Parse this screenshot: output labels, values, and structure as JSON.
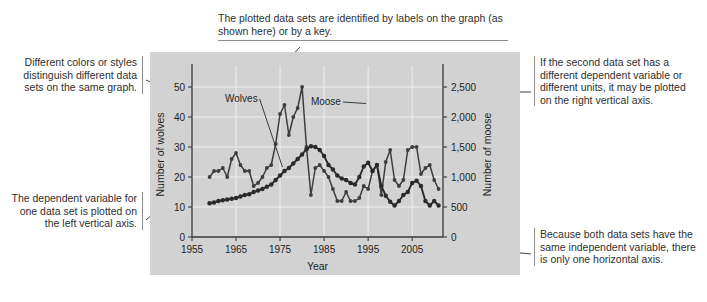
{
  "figure": {
    "kind": "annotated-chart-figure",
    "background": "#ffffff",
    "panel_color": "#d2d2d2"
  },
  "annotations": {
    "top": "The plotted data sets are identified by labels on the graph (as shown here) or by a key.",
    "left_top": "Different colors or styles distinguish different data sets on the same graph.",
    "left_bottom": "The dependent variable for one data set is plotted on the left vertical axis.",
    "right_top": "If the second data set has a different dependent variable or different units, it may be plotted on the right vertical axis.",
    "right_bottom": "Because both data sets have the same independent variable, there is only one horizontal axis."
  },
  "chart_data": {
    "type": "line",
    "title": "",
    "xlabel": "Year",
    "ylabel": "Number of wolves",
    "y2label": "Number of moose",
    "xlim": [
      1955,
      2012
    ],
    "ylim": [
      0,
      55
    ],
    "y2lim": [
      0,
      2750
    ],
    "xticks": [
      1955,
      1965,
      1975,
      1985,
      1995,
      2005
    ],
    "yticks": [
      0,
      10,
      20,
      30,
      40,
      50
    ],
    "y2ticks": [
      "0",
      "500",
      "1,000",
      "1,500",
      "2,000",
      "2,500"
    ],
    "y2tickvalues": [
      0,
      500,
      1000,
      1500,
      2000,
      2500
    ],
    "grid": true,
    "legend_position": "inline-labels",
    "series": [
      {
        "name": "Wolves",
        "axis": "left",
        "color": "#3d3d3d",
        "label_x": 1969,
        "label_y": 46,
        "x": [
          1959,
          1960,
          1961,
          1962,
          1963,
          1964,
          1965,
          1966,
          1967,
          1968,
          1969,
          1970,
          1971,
          1972,
          1973,
          1974,
          1975,
          1976,
          1977,
          1978,
          1979,
          1980,
          1981,
          1982,
          1983,
          1984,
          1985,
          1986,
          1987,
          1988,
          1989,
          1990,
          1991,
          1992,
          1993,
          1994,
          1995,
          1996,
          1997,
          1998,
          1999,
          2000,
          2001,
          2002,
          2003,
          2004,
          2005,
          2006,
          2007,
          2008,
          2009,
          2010,
          2011
        ],
        "values": [
          20,
          22,
          22,
          23,
          20,
          26,
          28,
          24,
          22,
          22,
          17,
          18,
          20,
          23,
          24,
          31,
          41,
          44,
          34,
          40,
          43,
          50,
          30,
          14,
          23,
          24,
          22,
          20,
          16,
          12,
          12,
          15,
          12,
          12,
          13,
          17,
          16,
          22,
          24,
          14,
          25,
          29,
          19,
          17,
          19,
          29,
          30,
          30,
          21,
          23,
          24,
          19,
          16
        ]
      },
      {
        "name": "Moose",
        "axis": "right",
        "color": "#2a2a2a",
        "label_x": 1987,
        "label_y": 45,
        "x": [
          1959,
          1960,
          1961,
          1962,
          1963,
          1964,
          1965,
          1966,
          1967,
          1968,
          1969,
          1970,
          1971,
          1972,
          1973,
          1974,
          1975,
          1976,
          1977,
          1978,
          1979,
          1980,
          1981,
          1982,
          1983,
          1984,
          1985,
          1986,
          1987,
          1988,
          1989,
          1990,
          1991,
          1992,
          1993,
          1994,
          1995,
          1996,
          1997,
          1998,
          1999,
          2000,
          2001,
          2002,
          2003,
          2004,
          2005,
          2006,
          2007,
          2008,
          2009,
          2010,
          2011
        ],
        "values": [
          563,
          575,
          600,
          613,
          625,
          638,
          650,
          675,
          700,
          713,
          750,
          775,
          800,
          838,
          875,
          950,
          1025,
          1100,
          1150,
          1225,
          1300,
          1375,
          1463,
          1513,
          1500,
          1450,
          1350,
          1200,
          1125,
          1025,
          975,
          950,
          900,
          875,
          1000,
          1175,
          1238,
          1100,
          1200,
          850,
          688,
          588,
          525,
          600,
          700,
          750,
          900,
          938,
          850,
          600,
          525,
          600,
          525
        ]
      }
    ],
    "annotations_inline": [
      {
        "text": "Wolves",
        "points_to_series": "Moose"
      },
      {
        "text": "Moose",
        "points_to_series": "Moose"
      }
    ]
  }
}
